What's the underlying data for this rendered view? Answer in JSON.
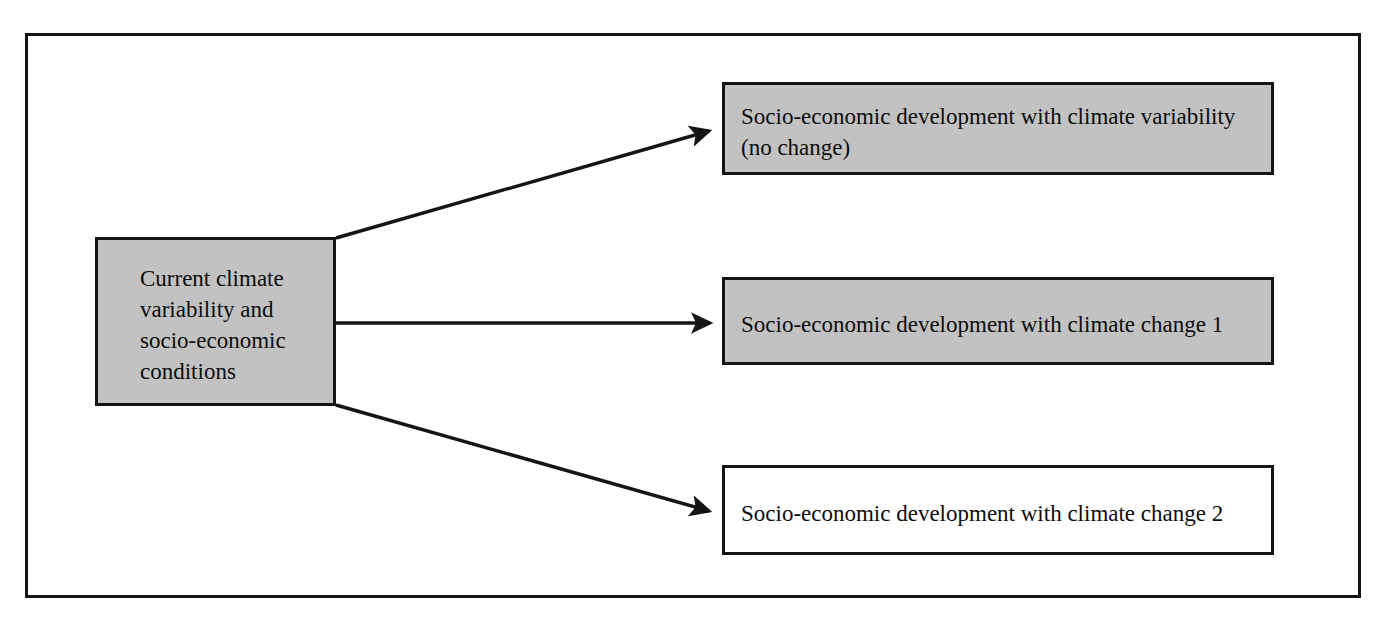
{
  "figure": {
    "type": "flow-diagram",
    "frame": {
      "border_color": "#151515",
      "background": "#ffffff"
    },
    "palette": {
      "box_fill_shaded": "#c2c2c2",
      "box_fill_plain": "#ffffff",
      "line_color": "#151515",
      "text_color": "#0d0d0d"
    },
    "source_node": {
      "id": "current-conditions",
      "label": "Current climate\nvariability and\nsocio-economic\nconditions",
      "fill": "shaded"
    },
    "outcome_nodes": [
      {
        "id": "no-change",
        "label": "Socio-economic development with climate variability\n(no change)",
        "fill": "shaded"
      },
      {
        "id": "climate-change-1",
        "label": "Socio-economic development with climate change 1",
        "fill": "shaded"
      },
      {
        "id": "climate-change-2",
        "label": "Socio-economic development with climate change 2",
        "fill": "plain"
      }
    ],
    "connectors": [
      {
        "id": "arrow-to-no-change",
        "from": "current-conditions",
        "to": "no-change",
        "style": "solid-arrow"
      },
      {
        "id": "arrow-to-climate-change-1",
        "from": "current-conditions",
        "to": "climate-change-1",
        "style": "solid-arrow"
      },
      {
        "id": "arrow-to-climate-change-2",
        "from": "current-conditions",
        "to": "climate-change-2",
        "style": "solid-arrow"
      }
    ]
  }
}
